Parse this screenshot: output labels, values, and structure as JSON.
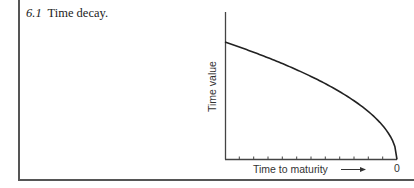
{
  "figure": {
    "number": "6.1",
    "caption": "Time decay."
  },
  "chart_data": {
    "type": "line",
    "title": "Time decay.",
    "xlabel": "Time to maturity",
    "xlabel_arrow": "→",
    "ylabel": "Time value",
    "x_tick_labels": [
      "0"
    ],
    "x_tick_count": 11,
    "x_direction": "decreasing toward maturity (0 at right)",
    "grid": false,
    "legend": null,
    "series": [
      {
        "name": "Time value",
        "x_time_to_maturity_fraction": [
          1.0,
          0.9,
          0.8,
          0.7,
          0.6,
          0.5,
          0.4,
          0.3,
          0.2,
          0.1,
          0.05,
          0.0
        ],
        "values_fraction_of_max": [
          1.0,
          0.949,
          0.894,
          0.837,
          0.775,
          0.707,
          0.632,
          0.548,
          0.447,
          0.316,
          0.224,
          0.0
        ]
      }
    ],
    "colors": {
      "line": "#222222",
      "axis": "#444444"
    }
  }
}
